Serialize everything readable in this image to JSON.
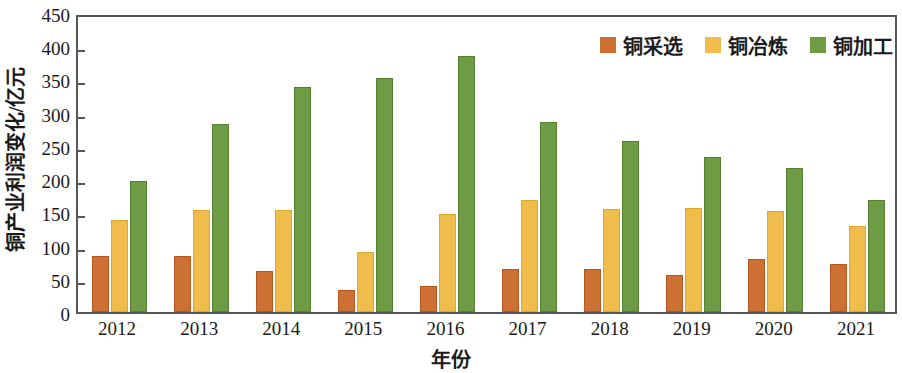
{
  "chart_data": {
    "type": "bar",
    "title": "",
    "xlabel": "年份",
    "ylabel": "铜产业利润变化/亿元",
    "categories": [
      "2012",
      "2013",
      "2014",
      "2015",
      "2016",
      "2017",
      "2018",
      "2019",
      "2020",
      "2021"
    ],
    "series": [
      {
        "name": "铜采选",
        "color": "#cc7033",
        "values": [
          84,
          84,
          61,
          33,
          39,
          64,
          64,
          55,
          80,
          73
        ]
      },
      {
        "name": "铜冶炼",
        "color": "#f0bd4d",
        "values": [
          139,
          153,
          154,
          91,
          148,
          169,
          155,
          157,
          152,
          130
        ]
      },
      {
        "name": "铜加工",
        "color": "#6d9c44",
        "values": [
          197,
          283,
          338,
          352,
          385,
          286,
          258,
          233,
          216,
          168
        ]
      }
    ],
    "ylim": [
      0,
      450
    ],
    "yticks": [
      0,
      50,
      100,
      150,
      200,
      250,
      300,
      350,
      400,
      450
    ],
    "grid": false,
    "legend_position": "top-right",
    "axis_color": "#55585a"
  }
}
